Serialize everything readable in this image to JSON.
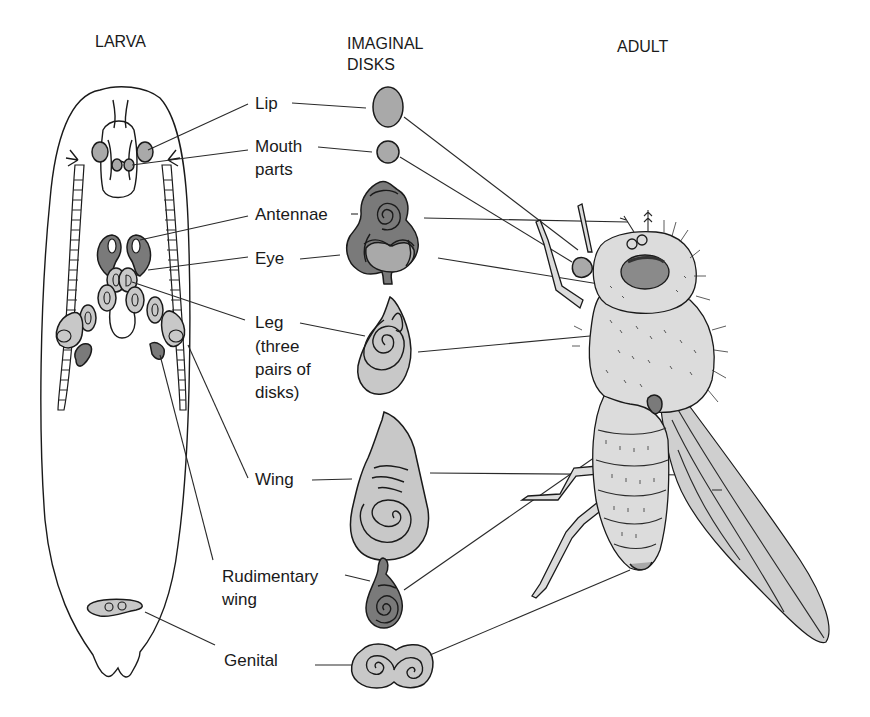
{
  "headers": {
    "larva": "LARVA",
    "imaginal_disks_line1": "IMAGINAL",
    "imaginal_disks_line2": "DISKS",
    "adult": "ADULT"
  },
  "labels": {
    "lip": "Lip",
    "mouth_parts_line1": "Mouth",
    "mouth_parts_line2": "parts",
    "antennae": "Antennae",
    "eye": "Eye",
    "leg_line1": "Leg",
    "leg_line2": "(three",
    "leg_line3": "pairs of",
    "leg_line4": "disks)",
    "wing": "Wing",
    "rudimentary_wing_line1": "Rudimentary",
    "rudimentary_wing_line2": "wing",
    "genital": "Genital"
  },
  "colors": {
    "background": "#ffffff",
    "ink": "#1a1a1a",
    "disk_light": "#c8c8c8",
    "disk_mid": "#a9a9a9",
    "disk_dark": "#7a7a7a"
  }
}
